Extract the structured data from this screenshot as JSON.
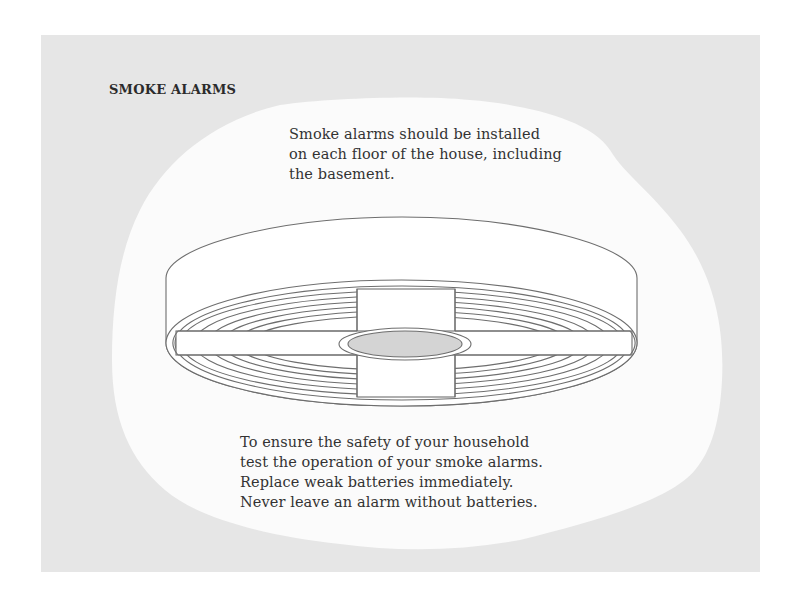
{
  "page": {
    "title": "SMOKE ALARMS",
    "top_note": {
      "lines": [
        "Smoke alarms should be installed",
        "on each floor of the house, including",
        "the basement."
      ]
    },
    "bottom_note": {
      "lines": [
        "To ensure the safety of your household",
        "test the operation of your smoke alarms.",
        "Replace weak batteries immediately.",
        "Never leave an alarm without batteries."
      ]
    }
  },
  "colors": {
    "page_background": "#ffffff",
    "panel_background": "#e6e6e6",
    "blob_background": "#fbfbfb",
    "line_stroke": "#6e6e6e",
    "grill_fill": "#d4d4d4",
    "text": "#333333"
  },
  "illustration": {
    "subject": "smoke-alarm",
    "view": "perspective-from-below"
  }
}
